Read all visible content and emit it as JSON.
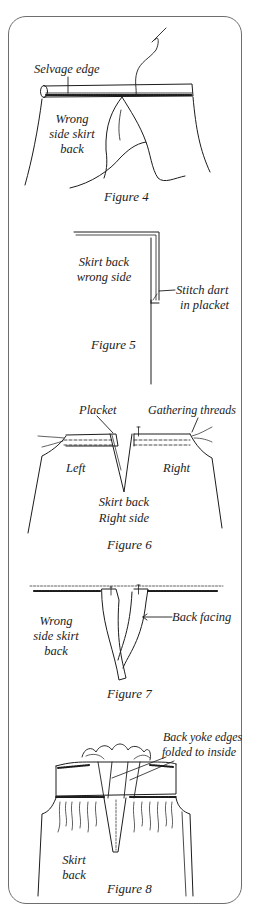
{
  "figures": [
    {
      "id": "figure-4",
      "caption": "Figure 4",
      "labels": {
        "selvage": "Selvage edge",
        "body_l1": "Wrong",
        "body_l2": "side skirt",
        "body_l3": "back"
      }
    },
    {
      "id": "figure-5",
      "caption": "Figure 5",
      "labels": {
        "body_l1": "Skirt back",
        "body_l2": "wrong side",
        "callout_l1": "Stitch dart",
        "callout_l2": "in placket"
      }
    },
    {
      "id": "figure-6",
      "caption": "Figure 6",
      "labels": {
        "placket": "Placket",
        "gathering": "Gathering threads",
        "left": "Left",
        "right": "Right",
        "body_l1": "Skirt back",
        "body_l2": "Right side"
      }
    },
    {
      "id": "figure-7",
      "caption": "Figure 7",
      "labels": {
        "body_l1": "Wrong",
        "body_l2": "side skirt",
        "body_l3": "back",
        "callout": "Back facing"
      }
    },
    {
      "id": "figure-8",
      "caption": "Figure 8",
      "labels": {
        "callout_l1": "Back yoke edges",
        "callout_l2": "folded to inside",
        "body_l1": "Skirt",
        "body_l2": "back"
      }
    }
  ],
  "colors": {
    "ink": "#1c1c1c",
    "frame": "#6e6e6e",
    "background": "#ffffff"
  }
}
